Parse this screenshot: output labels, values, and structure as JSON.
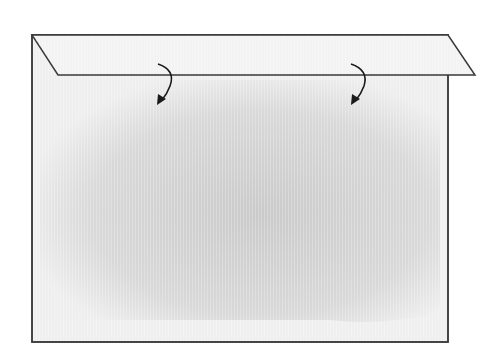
{
  "diagram": {
    "type": "fold-illustration",
    "colors": {
      "background": "#ffffff",
      "outline": "#3a3a3a",
      "flap_fill": "#f1f1f1",
      "body_fill_light": "#efefef",
      "body_fill_shade": "#c9c9c9",
      "arrow": "#1a1a1a"
    },
    "body": {
      "x": 32,
      "y": 35,
      "width": 416,
      "height": 307
    },
    "flap": {
      "points": [
        [
          32,
          35
        ],
        [
          448,
          35
        ],
        [
          475,
          75
        ],
        [
          58,
          75
        ]
      ]
    },
    "arrows": [
      {
        "name": "fold-arrow-left",
        "start": [
          160,
          64
        ],
        "end": [
          160,
          104
        ],
        "direction": "down-left-curved"
      },
      {
        "name": "fold-arrow-right",
        "start": [
          352,
          64
        ],
        "end": [
          352,
          104
        ],
        "direction": "down-left-curved"
      }
    ]
  }
}
